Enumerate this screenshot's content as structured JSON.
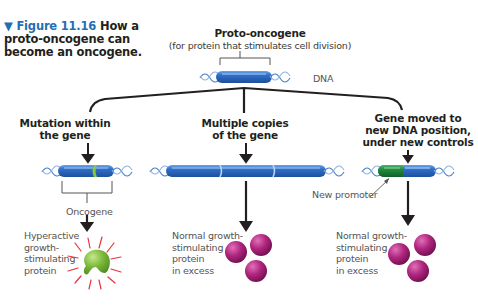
{
  "figure": {
    "number": "Figure 11.16",
    "marker": "▼",
    "title": "How a proto-oncogene can become an oncogene."
  },
  "top": {
    "title": "Proto-oncogene",
    "subtitle": "(for protein that stimulates cell division)",
    "dna_label": "DNA"
  },
  "branches": [
    {
      "heading_line1": "Mutation within",
      "heading_line2": "the gene",
      "gene_label": "Oncogene",
      "result_lines": [
        "Hyperactive",
        "growth-",
        "stimulating",
        "protein"
      ]
    },
    {
      "heading_line1": "Multiple copies",
      "heading_line2": "of the gene",
      "result_lines": [
        "Normal growth-",
        "stimulating",
        "protein",
        "in excess"
      ]
    },
    {
      "heading_line1": "Gene moved to",
      "heading_line2": "new DNA position,",
      "heading_line3": "under new controls",
      "promoter_label": "New promoter",
      "result_lines": [
        "Normal growth-",
        "stimulating",
        "protein",
        "in excess"
      ]
    }
  ],
  "colors": {
    "gene_blue": "#2e6fc9",
    "gene_highlight": "#8fc0f0",
    "mutation_green": "#8cc63f",
    "promoter_green": "#1f8a3a",
    "protein_green": "#7ab83a",
    "protein_magenta": "#b0267f",
    "ray_red": "#e8333a",
    "dna_strand": "#4a7fc4",
    "title_blue": "#1f6fb5"
  }
}
